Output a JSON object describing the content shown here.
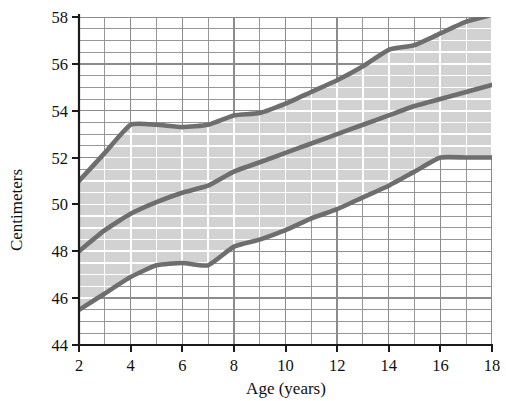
{
  "chart_data": {
    "type": "line",
    "title": "",
    "subtitle": "",
    "xlabel": "Age (years)",
    "ylabel": "Centimeters",
    "xlim": [
      2,
      18
    ],
    "ylim": [
      44,
      58
    ],
    "x_tick_labels": [
      "2",
      "4",
      "6",
      "8",
      "10",
      "12",
      "14",
      "16",
      "18"
    ],
    "x_ticks": [
      2,
      4,
      6,
      8,
      10,
      12,
      14,
      16,
      18
    ],
    "y_tick_labels": [
      "44",
      "46",
      "48",
      "50",
      "52",
      "54",
      "56",
      "58"
    ],
    "y_ticks": [
      44,
      46,
      48,
      50,
      52,
      54,
      56,
      58
    ],
    "grid": true,
    "grid_minor_x_step": 1,
    "grid_minor_y_step": 0.5,
    "legend": "none",
    "band_fill": true,
    "band_between": [
      "upper",
      "lower"
    ],
    "x": [
      2,
      3,
      4,
      5,
      6,
      7,
      8,
      9,
      10,
      11,
      12,
      13,
      14,
      15,
      16,
      17,
      18
    ],
    "series": [
      {
        "name": "upper",
        "label": "Upper percentile",
        "color": "#6e6e6e",
        "values": [
          51.0,
          52.2,
          53.4,
          53.4,
          53.3,
          53.4,
          53.8,
          53.9,
          54.3,
          54.8,
          55.3,
          55.9,
          56.6,
          56.8,
          57.3,
          57.8,
          58.1
        ]
      },
      {
        "name": "median",
        "label": "Median",
        "color": "#6e6e6e",
        "values": [
          48.0,
          48.9,
          49.6,
          50.1,
          50.5,
          50.8,
          51.4,
          51.8,
          52.2,
          52.6,
          53.0,
          53.4,
          53.8,
          54.2,
          54.5,
          54.8,
          55.1
        ]
      },
      {
        "name": "lower",
        "label": "Lower percentile",
        "color": "#6e6e6e",
        "values": [
          45.5,
          46.2,
          46.9,
          47.4,
          47.5,
          47.4,
          48.2,
          48.5,
          48.9,
          49.4,
          49.8,
          50.3,
          50.8,
          51.4,
          52.0,
          52.0,
          52.0
        ]
      }
    ],
    "colors": {
      "band_fill": "#d2d2d2",
      "curve": "#6e6e6e",
      "grid_outside": "#8c8c8c",
      "grid_inside": "#ffffff",
      "axis": "#1a1a1a",
      "text": "#101010",
      "background": "#ffffff"
    }
  }
}
